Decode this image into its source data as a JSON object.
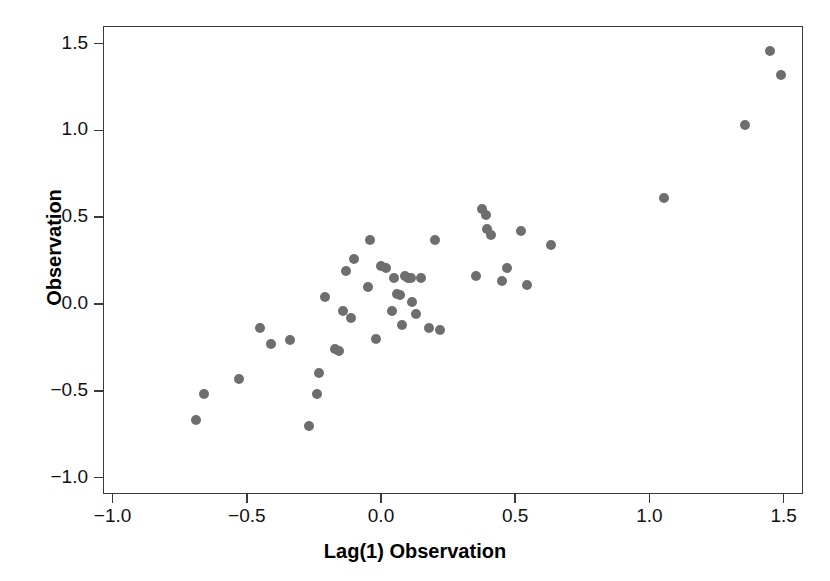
{
  "chart_data": {
    "type": "scatter",
    "title": "",
    "xlabel": "Lag(1) Observation",
    "ylabel": "Observation",
    "xlim": [
      -1.04,
      1.57
    ],
    "ylim": [
      -1.1,
      1.6
    ],
    "xticks": [
      -1.0,
      -0.5,
      0.0,
      0.5,
      1.0,
      1.5
    ],
    "xticklabels": [
      "−1.0",
      "−0.5",
      "0.0",
      "0.5",
      "1.0",
      "1.5"
    ],
    "yticks": [
      -1.0,
      -0.5,
      0.0,
      0.5,
      1.0,
      1.5
    ],
    "yticklabels": [
      "−1.0",
      "−0.5",
      "0.0",
      "0.5",
      "1.0",
      "1.5"
    ],
    "grid": false,
    "legend": null,
    "marker": "filled-circle",
    "marker_color": "#6e6e6e",
    "marker_size_px": 10,
    "frame_color": "#3a3a3a",
    "background": "#ffffff",
    "n_points": 48,
    "points": [
      {
        "x": -0.69,
        "y": -0.67
      },
      {
        "x": -0.66,
        "y": -0.52
      },
      {
        "x": -0.53,
        "y": -0.43
      },
      {
        "x": -0.45,
        "y": -0.14
      },
      {
        "x": -0.41,
        "y": -0.23
      },
      {
        "x": -0.34,
        "y": -0.21
      },
      {
        "x": -0.27,
        "y": -0.7
      },
      {
        "x": -0.24,
        "y": -0.52
      },
      {
        "x": -0.23,
        "y": -0.4
      },
      {
        "x": -0.21,
        "y": 0.04
      },
      {
        "x": -0.17,
        "y": -0.26
      },
      {
        "x": -0.155,
        "y": -0.27
      },
      {
        "x": -0.14,
        "y": -0.04
      },
      {
        "x": -0.13,
        "y": 0.19
      },
      {
        "x": -0.11,
        "y": -0.08
      },
      {
        "x": -0.1,
        "y": 0.26
      },
      {
        "x": -0.05,
        "y": 0.1
      },
      {
        "x": -0.04,
        "y": 0.37
      },
      {
        "x": -0.02,
        "y": -0.2
      },
      {
        "x": 0.0,
        "y": 0.22
      },
      {
        "x": 0.02,
        "y": 0.21
      },
      {
        "x": 0.04,
        "y": -0.04
      },
      {
        "x": 0.05,
        "y": 0.15
      },
      {
        "x": 0.06,
        "y": 0.06
      },
      {
        "x": 0.07,
        "y": 0.05
      },
      {
        "x": 0.08,
        "y": -0.12
      },
      {
        "x": 0.09,
        "y": 0.16
      },
      {
        "x": 0.1,
        "y": 0.15
      },
      {
        "x": 0.11,
        "y": 0.15
      },
      {
        "x": 0.115,
        "y": 0.01
      },
      {
        "x": 0.13,
        "y": -0.06
      },
      {
        "x": 0.15,
        "y": 0.15
      },
      {
        "x": 0.18,
        "y": -0.14
      },
      {
        "x": 0.2,
        "y": 0.37
      },
      {
        "x": 0.22,
        "y": -0.15
      },
      {
        "x": 0.355,
        "y": 0.16
      },
      {
        "x": 0.375,
        "y": 0.55
      },
      {
        "x": 0.39,
        "y": 0.51
      },
      {
        "x": 0.395,
        "y": 0.43
      },
      {
        "x": 0.41,
        "y": 0.4
      },
      {
        "x": 0.45,
        "y": 0.13
      },
      {
        "x": 0.47,
        "y": 0.21
      },
      {
        "x": 0.52,
        "y": 0.42
      },
      {
        "x": 0.545,
        "y": 0.11
      },
      {
        "x": 0.635,
        "y": 0.34
      },
      {
        "x": 1.055,
        "y": 0.61
      },
      {
        "x": 1.355,
        "y": 1.03
      },
      {
        "x": 1.45,
        "y": 1.46
      },
      {
        "x": 1.49,
        "y": 1.32
      }
    ]
  },
  "axis": {
    "x_title": "Lag(1) Observation",
    "y_title": "Observation"
  }
}
